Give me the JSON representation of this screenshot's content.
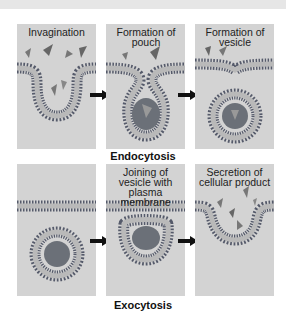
{
  "figure": {
    "rows": [
      {
        "caption": "Endocytosis",
        "panels": [
          {
            "label": "Invagination"
          },
          {
            "label": "Formation of pouch"
          },
          {
            "label": "Formation of vesicle"
          }
        ]
      },
      {
        "caption": "Exocytosis",
        "panels": [
          {
            "label": ""
          },
          {
            "label": "Joining of vesicle with plasma membrane"
          },
          {
            "label": "Secretion of cellular product"
          }
        ]
      }
    ],
    "colors": {
      "panel_bg": "#d3d3d3",
      "membrane_head": "#555a6a",
      "membrane_tail": "#b9b9b9",
      "vesicle_content": "#6b7078",
      "arrow": "#111111"
    }
  }
}
